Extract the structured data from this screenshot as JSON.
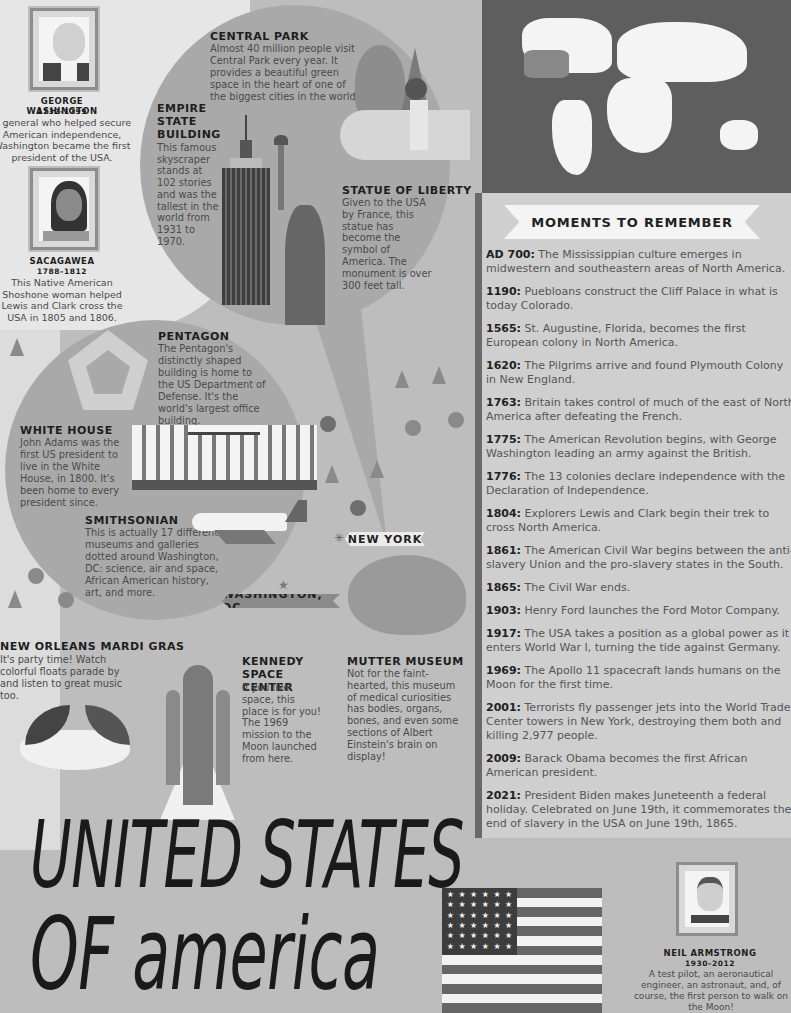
{
  "people": [
    {
      "name": "GEORGE WASHINGTON",
      "years": "1732–1799",
      "bio": "A general who helped secure American independence, Washington became the first president of the USA."
    },
    {
      "name": "SACAGAWEA",
      "years": "1788–1812",
      "bio": "This Native American Shoshone woman helped Lewis and Clark cross the USA in 1805 and 1806."
    },
    {
      "name": "NEIL ARMSTRONG",
      "years": "1930–2012",
      "bio": "A test pilot, an aeronautical engineer, an astronaut, and, of course, the first person to walk on the Moon!"
    }
  ],
  "landmarks": {
    "central_park": {
      "title": "CENTRAL PARK",
      "text": "Almost 40 million people visit Central Park every year. It provides a beautiful green space in the heart of one of the biggest cities in the world."
    },
    "empire_state": {
      "title": "EMPIRE STATE BUILDING",
      "text": "This famous skyscraper stands at 102 stories and was the tallest in the world from 1931 to 1970."
    },
    "statue_liberty": {
      "title": "STATUE OF LIBERTY",
      "text": "Given to the USA by France, this statue has become the symbol of America. The monument is over 300 feet tall."
    },
    "pentagon": {
      "title": "PENTAGON",
      "text": "The Pentagon's distinctly shaped building is home to the US Department of Defense. It's the world's largest office building."
    },
    "white_house": {
      "title": "WHITE HOUSE",
      "text": "John Adams was the first US president to live in the White House, in 1800. It's been home to every president since."
    },
    "smithsonian": {
      "title": "SMITHSONIAN",
      "text": "This is actually 17 different museums and galleries dotted around Washington, DC: science, air and space, African American history, art, and more."
    },
    "mardi_gras": {
      "title": "NEW ORLEANS MARDI GRAS",
      "text": "It's party time! Watch colorful floats parade by and listen to great music too."
    },
    "kennedy": {
      "title": "KENNEDY SPACE CENTER",
      "text": "If you like space, this place is for you! The 1969 mission to the Moon launched from here."
    },
    "mutter": {
      "title": "MUTTER MUSEUM",
      "text": "Not for the faint-hearted, this museum of medical curiosities has bodies, organs, bones, and even some sections of Albert Einstein's brain on display!"
    }
  },
  "cities": {
    "new_york": "NEW YORK",
    "washington_dc": "WASHINGTON, DC"
  },
  "moments": {
    "heading": "MOMENTS TO REMEMBER",
    "items": [
      {
        "year": "AD 700:",
        "text": "The Mississippian culture emerges in midwestern and southeastern areas of North America."
      },
      {
        "year": "1190:",
        "text": "Puebloans construct the Cliff Palace in what is today Colorado."
      },
      {
        "year": "1565:",
        "text": "St. Augustine, Florida, becomes the first European colony in North America."
      },
      {
        "year": "1620:",
        "text": "The Pilgrims arrive and found Plymouth Colony in New England."
      },
      {
        "year": "1763:",
        "text": "Britain takes control of much of the east of North America after defeating the French."
      },
      {
        "year": "1775:",
        "text": "The American Revolution begins, with George Washington leading an army against the British."
      },
      {
        "year": "1776:",
        "text": "The 13 colonies declare independence with the Declaration of Independence."
      },
      {
        "year": "1804:",
        "text": "Explorers Lewis and Clark begin their trek to cross North America."
      },
      {
        "year": "1861:",
        "text": "The American Civil War begins between the anti-slavery Union and the pro-slavery states in the South."
      },
      {
        "year": "1865:",
        "text": "The Civil War ends."
      },
      {
        "year": "1903:",
        "text": "Henry Ford launches the Ford Motor Company."
      },
      {
        "year": "1917:",
        "text": "The USA takes a position as a global power as it enters World War I, turning the tide against Germany."
      },
      {
        "year": "1969:",
        "text": "The Apollo 11 spacecraft lands humans on the Moon for the first time."
      },
      {
        "year": "2001:",
        "text": "Terrorists fly passenger jets into the World Trade Center towers in New York, destroying them both and killing 2,977 people."
      },
      {
        "year": "2009:",
        "text": "Barack Obama becomes the first African American president."
      },
      {
        "year": "2021:",
        "text": "President Biden makes Juneteenth a federal holiday. Celebrated on June 19th, it commemorates the end of slavery in the USA on June 19th, 1865."
      }
    ]
  },
  "title": {
    "line1": "UNITED STATES",
    "line2": "OF america"
  },
  "icons": {
    "star": "★",
    "burst": "✳"
  }
}
